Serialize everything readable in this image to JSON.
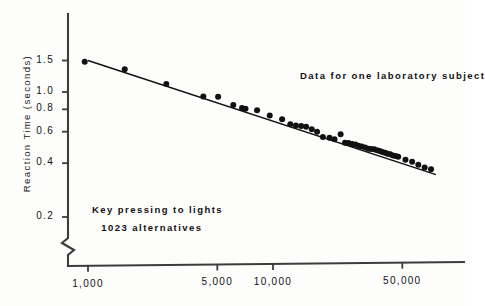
{
  "chart_data": {
    "type": "scatter",
    "title": "",
    "xlabel": "",
    "ylabel": "Reaction Time (seconds)",
    "xscale": "log",
    "yscale": "log",
    "xlim": [
      900,
      80000
    ],
    "ylim": [
      0.19,
      1.75
    ],
    "grid": false,
    "legend": null,
    "xtick_labels": [
      "1,000",
      "5,000",
      "10,000",
      "50,000"
    ],
    "xtick_values": [
      1000,
      5000,
      10000,
      50000
    ],
    "ytick_labels": [
      "1.5",
      "1.0",
      "0.8",
      "0.6",
      "0.4",
      "0.2"
    ],
    "ytick_values": [
      1.5,
      1.0,
      0.8,
      0.6,
      0.4,
      0.2
    ],
    "axis_break": "y-axis broken below 0.2",
    "annotations": [
      {
        "id": "subject-note",
        "text": "Data for one laboratory subject",
        "x": 14000,
        "y": 1.22
      },
      {
        "id": "task-note",
        "text": "Key pressing to lights",
        "x": 1050,
        "y": 0.215
      },
      {
        "id": "alternatives-note",
        "text": "1023 alternatives",
        "x": 1180,
        "y": 0.172
      }
    ],
    "series": [
      {
        "name": "Reaction time vs practice trials",
        "marker": "filled-circle",
        "color": "#111111",
        "points": [
          {
            "x": 960,
            "y": 1.475
          },
          {
            "x": 1580,
            "y": 1.34
          },
          {
            "x": 2650,
            "y": 1.11
          },
          {
            "x": 4200,
            "y": 0.945
          },
          {
            "x": 5050,
            "y": 0.94
          },
          {
            "x": 6100,
            "y": 0.845
          },
          {
            "x": 6800,
            "y": 0.815
          },
          {
            "x": 7100,
            "y": 0.805
          },
          {
            "x": 8200,
            "y": 0.79
          },
          {
            "x": 9600,
            "y": 0.74
          },
          {
            "x": 11200,
            "y": 0.705
          },
          {
            "x": 12400,
            "y": 0.66
          },
          {
            "x": 13300,
            "y": 0.65
          },
          {
            "x": 14200,
            "y": 0.645
          },
          {
            "x": 15100,
            "y": 0.64
          },
          {
            "x": 16200,
            "y": 0.62
          },
          {
            "x": 17300,
            "y": 0.6
          },
          {
            "x": 18600,
            "y": 0.56
          },
          {
            "x": 20200,
            "y": 0.555
          },
          {
            "x": 21500,
            "y": 0.545
          },
          {
            "x": 23200,
            "y": 0.58
          },
          {
            "x": 24500,
            "y": 0.52
          },
          {
            "x": 25600,
            "y": 0.518
          },
          {
            "x": 26800,
            "y": 0.512
          },
          {
            "x": 27900,
            "y": 0.508
          },
          {
            "x": 29000,
            "y": 0.5
          },
          {
            "x": 30200,
            "y": 0.495
          },
          {
            "x": 31500,
            "y": 0.49
          },
          {
            "x": 32800,
            "y": 0.482
          },
          {
            "x": 34000,
            "y": 0.48
          },
          {
            "x": 35200,
            "y": 0.478
          },
          {
            "x": 36500,
            "y": 0.472
          },
          {
            "x": 37800,
            "y": 0.468
          },
          {
            "x": 39000,
            "y": 0.462
          },
          {
            "x": 40300,
            "y": 0.458
          },
          {
            "x": 41600,
            "y": 0.452
          },
          {
            "x": 43000,
            "y": 0.448
          },
          {
            "x": 44500,
            "y": 0.442
          },
          {
            "x": 46000,
            "y": 0.438
          },
          {
            "x": 47500,
            "y": 0.434
          },
          {
            "x": 52000,
            "y": 0.418
          },
          {
            "x": 56500,
            "y": 0.408
          },
          {
            "x": 61000,
            "y": 0.392
          },
          {
            "x": 66000,
            "y": 0.378
          },
          {
            "x": 71500,
            "y": 0.37
          }
        ]
      }
    ],
    "fit_line": {
      "name": "power-law fit",
      "color": "#111111",
      "start": {
        "x": 1000,
        "y": 1.5
      },
      "end": {
        "x": 76000,
        "y": 0.345
      }
    }
  }
}
